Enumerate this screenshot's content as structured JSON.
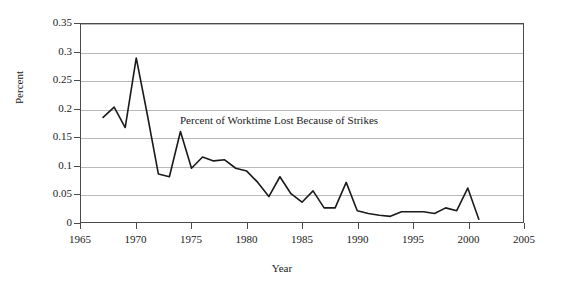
{
  "chart_data": {
    "type": "line",
    "title": "",
    "annotation": "Percent of Worktime Lost Because of Strikes",
    "xlabel": "Year",
    "ylabel": "Percent",
    "xlim": [
      1965,
      2005
    ],
    "ylim": [
      0,
      0.35
    ],
    "grid": true,
    "legend": "none",
    "xticks": [
      "1965",
      "1970",
      "1975",
      "1980",
      "1985",
      "1990",
      "1995",
      "2000",
      "2005"
    ],
    "xtick_values": [
      1965,
      1970,
      1975,
      1980,
      1985,
      1990,
      1995,
      2000,
      2005
    ],
    "yticks": [
      "0",
      "0.05",
      "0.1",
      "0.15",
      "0.2",
      "0.25",
      "0.3",
      "0.35"
    ],
    "ytick_values": [
      0,
      0.05,
      0.1,
      0.15,
      0.2,
      0.25,
      0.3,
      0.35
    ],
    "series": [
      {
        "name": "Percent of Worktime Lost Because of Strikes",
        "color": "#1a1a1a",
        "x": [
          1967,
          1968,
          1969,
          1970,
          1971,
          1972,
          1973,
          1974,
          1975,
          1976,
          1977,
          1978,
          1979,
          1980,
          1981,
          1982,
          1983,
          1984,
          1985,
          1986,
          1987,
          1988,
          1989,
          1990,
          1991,
          1992,
          1993,
          1994,
          1995,
          1996,
          1997,
          1998,
          1999,
          2000,
          2001
        ],
        "y": [
          0.185,
          0.203,
          0.167,
          0.29,
          0.19,
          0.085,
          0.08,
          0.16,
          0.095,
          0.115,
          0.108,
          0.11,
          0.095,
          0.09,
          0.07,
          0.045,
          0.08,
          0.05,
          0.035,
          0.055,
          0.025,
          0.025,
          0.07,
          0.02,
          0.015,
          0.012,
          0.01,
          0.018,
          0.018,
          0.018,
          0.015,
          0.025,
          0.02,
          0.06,
          0.005
        ]
      }
    ]
  }
}
